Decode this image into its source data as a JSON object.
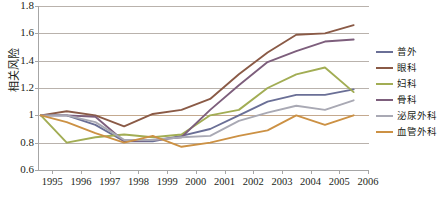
{
  "chart_data": {
    "type": "line",
    "title": "",
    "xlabel": "",
    "ylabel": "相关风险",
    "xlim": [
      1994.5,
      2006
    ],
    "ylim": [
      0.6,
      1.8
    ],
    "ytick_step": 0.2,
    "grid": true,
    "legend_position": "right",
    "xticks": [
      "1995",
      "1996",
      "1997",
      "1998",
      "1999",
      "2000",
      "2001",
      "2002",
      "2003",
      "2004",
      "2005",
      "2006"
    ],
    "yticks": [
      "1.8",
      "1.6",
      "1.4",
      "1.2",
      "1",
      "0.8",
      "0.6"
    ],
    "x": [
      1994.6,
      1995.5,
      1996.5,
      1997.5,
      1998.5,
      1999.5,
      2000.5,
      2001.5,
      2002.5,
      2003.5,
      2004.5,
      2005.5
    ],
    "series": [
      {
        "name": "普外",
        "color": "#6a6f96",
        "values": [
          1.0,
          1.0,
          0.93,
          0.81,
          0.81,
          0.85,
          0.9,
          1.0,
          1.1,
          1.15,
          1.15,
          1.19
        ]
      },
      {
        "name": "眼科",
        "color": "#8a5a46",
        "values": [
          1.0,
          1.03,
          1.0,
          0.92,
          1.01,
          1.04,
          1.12,
          1.3,
          1.46,
          1.59,
          1.6,
          1.66
        ]
      },
      {
        "name": "妇科",
        "color": "#a2ad54",
        "values": [
          1.0,
          0.8,
          0.84,
          0.86,
          0.84,
          0.86,
          1.0,
          1.04,
          1.2,
          1.3,
          1.35,
          1.17
        ]
      },
      {
        "name": "骨科",
        "color": "#7d5e7c",
        "values": [
          1.0,
          1.0,
          0.99,
          0.81,
          0.82,
          0.84,
          1.04,
          1.22,
          1.39,
          1.47,
          1.54,
          1.555
        ]
      },
      {
        "name": "泌尿外科",
        "color": "#a9a9b4",
        "values": [
          1.0,
          1.0,
          0.95,
          0.82,
          0.82,
          0.84,
          0.85,
          0.96,
          1.02,
          1.07,
          1.04,
          1.11
        ]
      },
      {
        "name": "血管外科",
        "color": "#cc9144",
        "values": [
          1.0,
          0.95,
          0.87,
          0.8,
          0.85,
          0.77,
          0.8,
          0.85,
          0.89,
          1.0,
          0.93,
          1.0
        ]
      }
    ]
  },
  "legend": {
    "items": [
      {
        "label": "普外"
      },
      {
        "label": "眼科"
      },
      {
        "label": "妇科"
      },
      {
        "label": "骨科"
      },
      {
        "label": "泌尿外科"
      },
      {
        "label": "血管外科"
      }
    ]
  }
}
